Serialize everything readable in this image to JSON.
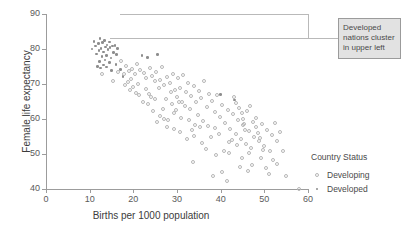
{
  "chart_data": {
    "type": "scatter",
    "title": "",
    "xlabel": "Births per 1000 population",
    "ylabel": "Female life expectancy",
    "xlim": [
      0,
      60
    ],
    "ylim": [
      40,
      90
    ],
    "xticks": [
      0,
      10,
      20,
      30,
      40,
      50,
      60
    ],
    "yticks": [
      40,
      50,
      60,
      70,
      80,
      90
    ],
    "grid": false,
    "legend": {
      "title": "Country Status",
      "position": "right",
      "entries": [
        {
          "label": "Developing",
          "marker": "open-circle",
          "color": "#b6b6b6"
        },
        {
          "label": "Developed",
          "marker": "filled-dot",
          "color": "#8d8d8d"
        }
      ]
    },
    "annotations": [
      {
        "text": "Developed nations cluster in upper left",
        "lines": [
          "Developed",
          "nations cluster",
          "in upper left"
        ],
        "box_fill": "#e2e2e2",
        "box_border": "#9b9b9b",
        "points_to": "upper-left-cluster"
      }
    ],
    "series": [
      {
        "name": "Developed",
        "marker": "filled-dot",
        "points": [
          [
            10.5,
            80.0
          ],
          [
            11.0,
            82.2
          ],
          [
            11.4,
            80.9
          ],
          [
            11.6,
            78.6
          ],
          [
            12.0,
            81.5
          ],
          [
            12.1,
            79.6
          ],
          [
            12.4,
            83.0
          ],
          [
            12.6,
            80.2
          ],
          [
            12.8,
            77.8
          ],
          [
            13.0,
            81.8
          ],
          [
            13.2,
            79.2
          ],
          [
            13.4,
            82.4
          ],
          [
            13.6,
            80.6
          ],
          [
            13.8,
            78.1
          ],
          [
            14.0,
            81.2
          ],
          [
            14.2,
            79.8
          ],
          [
            14.5,
            82.0
          ],
          [
            14.7,
            80.4
          ],
          [
            14.9,
            77.4
          ],
          [
            15.2,
            80.8
          ],
          [
            15.5,
            79.0
          ],
          [
            15.8,
            81.0
          ],
          [
            16.1,
            78.4
          ],
          [
            16.4,
            80.1
          ],
          [
            11.8,
            75.0
          ],
          [
            12.5,
            74.6
          ],
          [
            13.1,
            75.4
          ],
          [
            13.9,
            74.8
          ],
          [
            14.6,
            76.2
          ],
          [
            15.0,
            73.8
          ],
          [
            16.0,
            75.6
          ],
          [
            17.0,
            74.2
          ],
          [
            13.5,
            76.8
          ],
          [
            12.2,
            76.4
          ],
          [
            22.0,
            78.2
          ],
          [
            23.2,
            77.6
          ],
          [
            25.6,
            78.4
          ],
          [
            17.6,
            72.2
          ],
          [
            40.0,
            67.0
          ],
          [
            43.2,
            65.4
          ]
        ]
      },
      {
        "name": "Developing",
        "marker": "open-circle",
        "points": [
          [
            17.2,
            76.6
          ],
          [
            18.4,
            75.2
          ],
          [
            19.0,
            73.6
          ],
          [
            19.8,
            74.4
          ],
          [
            20.4,
            72.8
          ],
          [
            20.9,
            75.8
          ],
          [
            21.6,
            74.0
          ],
          [
            22.4,
            73.2
          ],
          [
            23.0,
            71.8
          ],
          [
            23.8,
            74.6
          ],
          [
            24.2,
            72.4
          ],
          [
            24.9,
            70.8
          ],
          [
            25.2,
            73.4
          ],
          [
            26.0,
            71.2
          ],
          [
            26.6,
            74.8
          ],
          [
            27.1,
            69.6
          ],
          [
            27.8,
            72.0
          ],
          [
            28.4,
            70.2
          ],
          [
            29.0,
            73.0
          ],
          [
            29.6,
            68.4
          ],
          [
            30.2,
            71.6
          ],
          [
            30.8,
            69.0
          ],
          [
            31.4,
            72.6
          ],
          [
            32.0,
            67.8
          ],
          [
            32.6,
            70.4
          ],
          [
            33.2,
            66.6
          ],
          [
            33.8,
            69.4
          ],
          [
            34.4,
            64.8
          ],
          [
            35.0,
            68.0
          ],
          [
            35.6,
            66.0
          ],
          [
            36.2,
            71.0
          ],
          [
            36.8,
            63.4
          ],
          [
            37.4,
            67.2
          ],
          [
            38.0,
            65.2
          ],
          [
            38.6,
            62.0
          ],
          [
            39.2,
            66.8
          ],
          [
            39.8,
            60.6
          ],
          [
            40.4,
            64.0
          ],
          [
            41.0,
            58.8
          ],
          [
            41.6,
            62.6
          ],
          [
            42.2,
            57.2
          ],
          [
            42.8,
            61.4
          ],
          [
            43.4,
            55.8
          ],
          [
            44.0,
            59.8
          ],
          [
            44.6,
            54.4
          ],
          [
            45.2,
            58.2
          ],
          [
            45.8,
            53.0
          ],
          [
            46.4,
            56.6
          ],
          [
            47.0,
            51.6
          ],
          [
            47.6,
            55.0
          ],
          [
            48.2,
            60.2
          ],
          [
            48.8,
            53.6
          ],
          [
            49.4,
            58.6
          ],
          [
            50.0,
            52.2
          ],
          [
            50.6,
            57.0
          ],
          [
            51.2,
            50.8
          ],
          [
            51.8,
            55.4
          ],
          [
            52.4,
            59.0
          ],
          [
            53.0,
            53.8
          ],
          [
            53.6,
            56.2
          ],
          [
            21.0,
            70.0
          ],
          [
            22.8,
            68.6
          ],
          [
            24.0,
            66.4
          ],
          [
            25.8,
            68.8
          ],
          [
            27.4,
            65.8
          ],
          [
            28.8,
            64.4
          ],
          [
            30.0,
            66.2
          ],
          [
            31.8,
            63.6
          ],
          [
            33.0,
            62.8
          ],
          [
            34.8,
            61.2
          ],
          [
            36.0,
            59.4
          ],
          [
            37.2,
            58.0
          ],
          [
            38.8,
            57.4
          ],
          [
            19.4,
            71.4
          ],
          [
            20.0,
            69.2
          ],
          [
            23.6,
            67.2
          ],
          [
            26.8,
            63.0
          ],
          [
            29.2,
            61.8
          ],
          [
            31.0,
            60.4
          ],
          [
            35.2,
            57.8
          ],
          [
            43.0,
            66.2
          ],
          [
            43.6,
            64.6
          ],
          [
            44.2,
            63.2
          ],
          [
            44.8,
            61.6
          ],
          [
            45.0,
            60.0
          ],
          [
            45.4,
            58.6
          ],
          [
            45.6,
            57.0
          ],
          [
            46.0,
            62.2
          ],
          [
            46.8,
            63.8
          ],
          [
            47.4,
            59.2
          ],
          [
            48.0,
            57.6
          ],
          [
            48.6,
            56.0
          ],
          [
            49.0,
            54.6
          ],
          [
            49.8,
            51.2
          ],
          [
            42.0,
            50.2
          ],
          [
            40.8,
            50.8
          ],
          [
            44.4,
            46.4
          ],
          [
            46.2,
            45.2
          ],
          [
            52.0,
            48.4
          ],
          [
            54.2,
            51.0
          ],
          [
            33.6,
            47.6
          ],
          [
            38.2,
            43.6
          ],
          [
            40.2,
            44.8
          ],
          [
            41.4,
            42.2
          ],
          [
            47.2,
            47.0
          ],
          [
            50.4,
            46.0
          ],
          [
            51.0,
            44.4
          ],
          [
            34.0,
            55.2
          ],
          [
            35.8,
            53.2
          ],
          [
            36.6,
            51.4
          ],
          [
            39.0,
            49.6
          ],
          [
            30.6,
            56.4
          ],
          [
            32.2,
            54.2
          ],
          [
            28.0,
            59.6
          ],
          [
            29.4,
            57.2
          ],
          [
            26.2,
            61.0
          ],
          [
            27.0,
            60.0
          ],
          [
            24.6,
            62.4
          ],
          [
            22.2,
            65.0
          ],
          [
            20.6,
            67.4
          ],
          [
            18.8,
            70.6
          ],
          [
            17.8,
            72.8
          ],
          [
            19.2,
            68.2
          ],
          [
            21.4,
            66.8
          ],
          [
            23.4,
            64.2
          ],
          [
            25.0,
            65.6
          ],
          [
            12.8,
            73.0
          ],
          [
            16.6,
            73.4
          ],
          [
            15.4,
            71.0
          ],
          [
            18.0,
            69.8
          ],
          [
            28.6,
            67.6
          ],
          [
            30.4,
            64.8
          ],
          [
            32.8,
            59.8
          ],
          [
            34.2,
            58.4
          ],
          [
            37.8,
            54.8
          ],
          [
            41.8,
            53.4
          ],
          [
            43.8,
            52.6
          ],
          [
            46.6,
            50.4
          ],
          [
            49.2,
            49.0
          ],
          [
            52.8,
            47.2
          ],
          [
            55.0,
            43.8
          ],
          [
            58.0,
            40.0
          ],
          [
            31.2,
            65.0
          ],
          [
            29.8,
            62.6
          ],
          [
            27.6,
            57.8
          ],
          [
            25.4,
            59.2
          ],
          [
            33.4,
            57.0
          ],
          [
            39.6,
            55.6
          ],
          [
            42.6,
            54.0
          ],
          [
            44.8,
            48.8
          ]
        ]
      }
    ]
  }
}
